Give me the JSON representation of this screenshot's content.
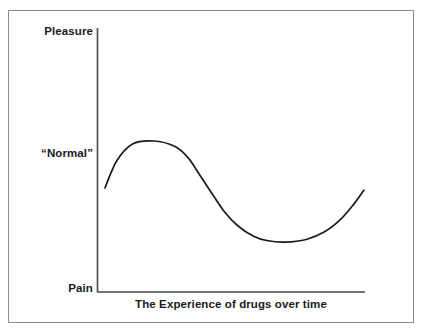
{
  "figure": {
    "background_color": "#ffffff",
    "frame_color": "#8d8d8d"
  },
  "chart_data": {
    "type": "line",
    "title": "",
    "xlabel": "The Experience of drugs over time",
    "ylabel": "",
    "grid": false,
    "legend": "none",
    "line_color": "#1a1a1a",
    "axis_color": "#4a4a4a",
    "y_axis_category_labels": [
      "Pleasure",
      "“Normal”",
      "Pain"
    ],
    "y_axis_category_positions": [
      1.0,
      0.575,
      0.0
    ],
    "x_axis_tick_labels": [],
    "xlim": [
      0,
      1
    ],
    "ylim": [
      0,
      1
    ],
    "series": [
      {
        "name": "Experience of drugs over time",
        "x": [
          0.015,
          0.06,
          0.12,
          0.2,
          0.28,
          0.33,
          0.37,
          0.42,
          0.47,
          0.52,
          0.58,
          0.63,
          0.7,
          0.78,
          0.85,
          0.91,
          0.96,
          1.0
        ],
        "y": [
          0.394,
          0.497,
          0.561,
          0.572,
          0.552,
          0.51,
          0.452,
          0.376,
          0.303,
          0.251,
          0.211,
          0.195,
          0.189,
          0.199,
          0.228,
          0.274,
          0.331,
          0.386
        ]
      }
    ],
    "annotations": [
      {
        "name": "onset-rise",
        "description": "Curve rises from below “Normal” to a peak above it"
      },
      {
        "name": "peak",
        "description": "Highest point of the curve, above the “Normal” line",
        "x": 0.2,
        "y": 0.572
      },
      {
        "name": "crash",
        "description": "Steep descent toward Pain after the peak"
      },
      {
        "name": "trough",
        "description": "Lowest point of the curve, far below “Normal”",
        "x": 0.7,
        "y": 0.189
      },
      {
        "name": "recovery",
        "description": "Gradual rise back toward the starting level"
      }
    ]
  }
}
